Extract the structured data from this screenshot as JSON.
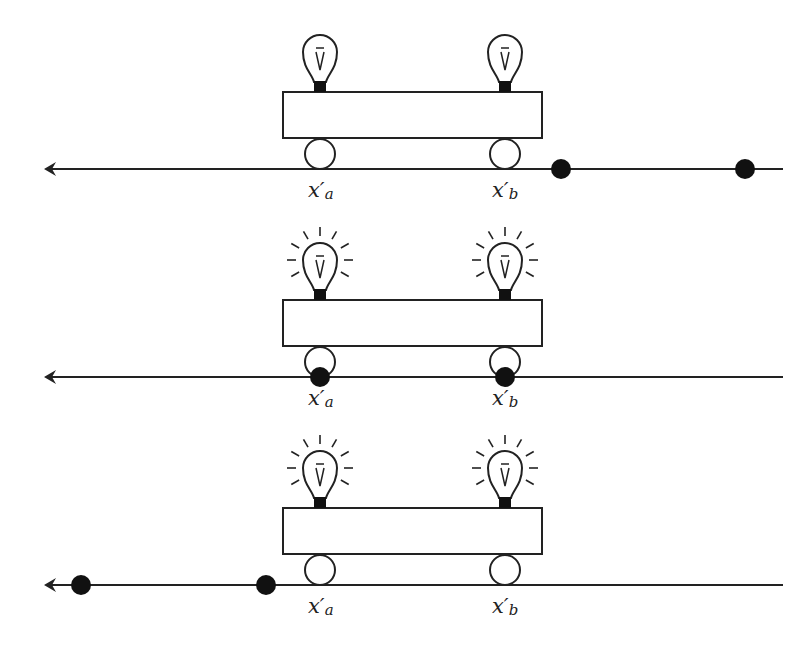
{
  "diagram": {
    "panels": [
      {
        "name": "panel-1",
        "line_y": 169,
        "car": {
          "x": 283,
          "y": 92,
          "w": 259,
          "h": 46
        },
        "bulbs_lit": false,
        "wheels": [
          320,
          505
        ],
        "flash_points": [
          561,
          745
        ],
        "labels": [
          {
            "base": "x",
            "prime": "′",
            "sub": "a",
            "x": 308,
            "y": 178
          },
          {
            "base": "x",
            "prime": "′",
            "sub": "b",
            "x": 492,
            "y": 178
          }
        ]
      },
      {
        "name": "panel-2",
        "line_y": 377,
        "car": {
          "x": 283,
          "y": 300,
          "w": 259,
          "h": 46
        },
        "bulbs_lit": true,
        "wheels": [
          320,
          505
        ],
        "flash_points": [
          320,
          505
        ],
        "labels": [
          {
            "base": "x",
            "prime": "′",
            "sub": "a",
            "x": 308,
            "y": 386
          },
          {
            "base": "x",
            "prime": "′",
            "sub": "b",
            "x": 492,
            "y": 386
          }
        ]
      },
      {
        "name": "panel-3",
        "line_y": 585,
        "car": {
          "x": 283,
          "y": 508,
          "w": 259,
          "h": 46
        },
        "bulbs_lit": true,
        "wheels": [
          320,
          505
        ],
        "flash_points": [
          81,
          266
        ],
        "labels": [
          {
            "base": "x",
            "prime": "′",
            "sub": "a",
            "x": 308,
            "y": 594
          },
          {
            "base": "x",
            "prime": "′",
            "sub": "b",
            "x": 492,
            "y": 594
          }
        ]
      }
    ],
    "line_start_x": 44,
    "line_end_x": 783,
    "colors": {
      "stroke": "#222222",
      "fill_dot": "#111111",
      "background": "#ffffff"
    }
  }
}
